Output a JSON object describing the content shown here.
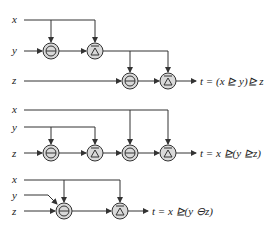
{
  "colors": {
    "line": "#333333",
    "node_fill": "#d9d9d9",
    "text": "#222222"
  },
  "diagrams": [
    {
      "inputs": [
        "x",
        "y",
        "z"
      ],
      "operators": [
        "ominus",
        "bar-triangle",
        "ominus",
        "bar-triangle"
      ],
      "formula": "t = (x ⊵ y)⊵ z"
    },
    {
      "inputs": [
        "x",
        "y",
        "z"
      ],
      "operators": [
        "ominus",
        "bar-triangle",
        "ominus",
        "bar-triangle"
      ],
      "formula": "t = x ⊵(y ⊵z)"
    },
    {
      "inputs": [
        "x",
        "y",
        "z"
      ],
      "operators": [
        "ominus",
        "bar-triangle"
      ],
      "formula": "t = x ⊵(y ⊖z)"
    }
  ]
}
